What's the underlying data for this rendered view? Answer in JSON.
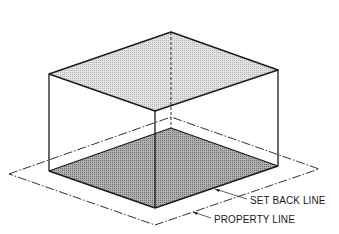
{
  "diagram": {
    "type": "isometric-zoning-envelope",
    "labels": {
      "set_back_line": "SET BACK LINE",
      "property_line": "PROPERTY LINE"
    },
    "colors": {
      "stroke": "#1a1a1a",
      "top_face_fill": "#d4d4d4",
      "floor_fill": "#9e9e9e",
      "background": "#ffffff"
    },
    "box": {
      "top_face": [
        [
          49,
          74
        ],
        [
          171,
          32
        ],
        [
          278,
          70
        ],
        [
          155,
          111
        ]
      ],
      "bottom_face": [
        [
          49,
          171
        ],
        [
          171,
          128
        ],
        [
          278,
          166
        ],
        [
          155,
          208
        ]
      ]
    },
    "property_line": [
      [
        9,
        174
      ],
      [
        171,
        117
      ],
      [
        319,
        169
      ],
      [
        155,
        225
      ]
    ]
  }
}
